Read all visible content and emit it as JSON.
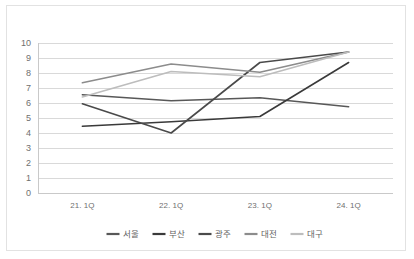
{
  "chart_data": {
    "type": "line",
    "title": "",
    "xlabel": "",
    "ylabel": "",
    "categories": [
      "21. 1Q",
      "22. 1Q",
      "23. 1Q",
      "24. 1Q"
    ],
    "ylim": [
      0,
      10
    ],
    "ytick_labels": [
      "10",
      "9",
      "8",
      "7",
      "6",
      "5",
      "4",
      "3",
      "2",
      "1",
      "0"
    ],
    "ytick_values": [
      10,
      9,
      8,
      7,
      6,
      5,
      4,
      3,
      2,
      1,
      0
    ],
    "grid": true,
    "legend_position": "bottom",
    "series": [
      {
        "name": "서울",
        "values": [
          6.55,
          6.15,
          6.35,
          5.75
        ],
        "color": "#585858"
      },
      {
        "name": "부산",
        "values": [
          4.45,
          4.75,
          5.1,
          8.7
        ],
        "color": "#3a3a3a"
      },
      {
        "name": "광주",
        "values": [
          5.95,
          4.0,
          8.7,
          9.4
        ],
        "color": "#4a4a4a"
      },
      {
        "name": "대전",
        "values": [
          7.35,
          8.6,
          8.05,
          9.4
        ],
        "color": "#8c8c8c"
      },
      {
        "name": "대구",
        "values": [
          6.4,
          8.1,
          7.75,
          9.4
        ],
        "color": "#bdbdbd"
      }
    ]
  },
  "colors": {
    "frame_border": "#e2e2e2",
    "gridline": "#d9d9d9",
    "axis": "#c9c9c9",
    "tick_text": "#6f6f6f",
    "legend_text": "#5f5f5f",
    "background": "#ffffff"
  }
}
